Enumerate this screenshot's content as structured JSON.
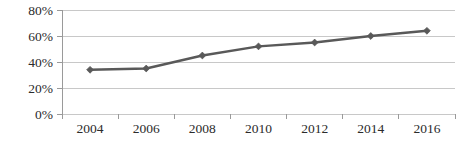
{
  "chart_data": {
    "type": "line",
    "title": "",
    "subtitle": "",
    "xlabel": "",
    "ylabel": "",
    "categories": [
      "2004",
      "2006",
      "2008",
      "2010",
      "2012",
      "2014",
      "2016"
    ],
    "x": [
      2004,
      2006,
      2008,
      2010,
      2012,
      2014,
      2016
    ],
    "values": [
      34,
      35,
      45,
      52,
      55,
      60,
      64
    ],
    "series": [
      {
        "name": "",
        "values": [
          34,
          35,
          45,
          52,
          55,
          60,
          64
        ]
      }
    ],
    "ylim": [
      0,
      80
    ],
    "xlim_categories": [
      "2004",
      "2016"
    ],
    "ytick_values": [
      0,
      20,
      40,
      60,
      80
    ],
    "ytick_labels": [
      "0%",
      "20%",
      "40%",
      "60%",
      "80%"
    ],
    "xtick_labels": [
      "2004",
      "2006",
      "2008",
      "2010",
      "2012",
      "2014",
      "2016"
    ],
    "grid": true,
    "grid_axis": "y",
    "legend": false,
    "legend_position": "none",
    "annotations": [],
    "marker": "diamond",
    "colors": {
      "line": "#595959",
      "marker": "#595959",
      "grid": "#c8c8c8",
      "axis": "#9a9a9a",
      "tick_label": "#2b2b2b",
      "background": "#ffffff"
    }
  },
  "geometry": {
    "plot_left": 62,
    "plot_right": 455,
    "plot_top": 10,
    "plot_bottom": 114,
    "axis_tick_len": 5,
    "xlabel_y": 133
  }
}
